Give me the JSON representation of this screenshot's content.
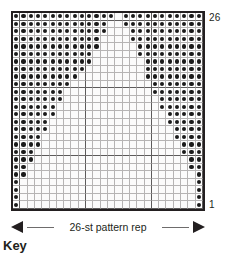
{
  "chart_data": {
    "type": "heatmap",
    "title": "",
    "subtitle": "",
    "xlabel": "26-st pattern rep",
    "ylabel": "",
    "grid": true,
    "legend_position": "below",
    "columns": 26,
    "rows": 26,
    "row_labels_shown": [
      "26",
      "1"
    ],
    "row_label_top": "26",
    "row_label_bottom": "1",
    "cell_values": {
      "filled": "dot symbol stitch",
      "empty": "blank stitch"
    },
    "colors": {
      "filled_dot": "#1a1a1a",
      "cell_background": "#fbfbfb",
      "grid_line": "#b6b4b4",
      "heavy_grid_line": "#5d5b5b",
      "border": "#231f20",
      "text": "#231f20"
    },
    "heavy_gridline_columns": [
      1,
      10,
      19,
      26
    ],
    "heavy_gridline_rows": [
      1,
      10,
      19,
      26
    ],
    "matrix": [
      [
        1,
        1,
        1,
        1,
        1,
        1,
        1,
        1,
        1,
        1,
        1,
        1,
        1,
        1,
        0,
        1,
        1,
        1,
        1,
        1,
        1,
        1,
        1,
        1,
        1,
        1
      ],
      [
        1,
        1,
        1,
        1,
        1,
        1,
        1,
        1,
        1,
        1,
        1,
        1,
        1,
        0,
        0,
        1,
        1,
        1,
        1,
        1,
        1,
        1,
        1,
        1,
        1,
        1
      ],
      [
        1,
        1,
        1,
        1,
        1,
        1,
        1,
        1,
        1,
        1,
        1,
        1,
        1,
        0,
        0,
        0,
        1,
        1,
        1,
        1,
        1,
        1,
        1,
        1,
        1,
        1
      ],
      [
        1,
        1,
        1,
        1,
        1,
        1,
        1,
        1,
        1,
        1,
        1,
        1,
        0,
        0,
        0,
        0,
        1,
        1,
        1,
        1,
        1,
        1,
        1,
        1,
        1,
        1
      ],
      [
        1,
        1,
        1,
        1,
        1,
        1,
        1,
        1,
        1,
        1,
        1,
        1,
        0,
        0,
        0,
        0,
        0,
        1,
        1,
        1,
        1,
        1,
        1,
        1,
        1,
        1
      ],
      [
        1,
        1,
        1,
        1,
        1,
        1,
        1,
        1,
        1,
        1,
        1,
        0,
        0,
        0,
        0,
        0,
        0,
        1,
        1,
        1,
        1,
        1,
        1,
        1,
        1,
        1
      ],
      [
        1,
        1,
        1,
        1,
        1,
        1,
        1,
        1,
        1,
        1,
        1,
        0,
        0,
        0,
        0,
        0,
        0,
        0,
        1,
        1,
        1,
        1,
        1,
        1,
        1,
        1
      ],
      [
        1,
        1,
        1,
        1,
        1,
        1,
        1,
        1,
        1,
        1,
        0,
        0,
        0,
        0,
        0,
        0,
        0,
        0,
        1,
        1,
        1,
        1,
        1,
        1,
        1,
        1
      ],
      [
        1,
        1,
        1,
        1,
        1,
        1,
        1,
        1,
        1,
        0,
        0,
        0,
        0,
        0,
        0,
        0,
        0,
        0,
        1,
        1,
        1,
        1,
        1,
        1,
        1,
        1
      ],
      [
        1,
        1,
        1,
        1,
        1,
        1,
        1,
        1,
        0,
        0,
        0,
        0,
        0,
        0,
        0,
        0,
        0,
        0,
        0,
        1,
        1,
        1,
        1,
        1,
        1,
        1
      ],
      [
        1,
        1,
        1,
        1,
        1,
        1,
        1,
        0,
        0,
        0,
        0,
        0,
        0,
        0,
        0,
        0,
        0,
        0,
        0,
        1,
        1,
        1,
        1,
        1,
        1,
        1
      ],
      [
        1,
        1,
        1,
        1,
        1,
        1,
        1,
        0,
        0,
        0,
        0,
        0,
        0,
        0,
        0,
        0,
        0,
        0,
        0,
        0,
        1,
        1,
        1,
        1,
        1,
        1
      ],
      [
        1,
        1,
        1,
        1,
        1,
        1,
        0,
        0,
        0,
        0,
        0,
        0,
        0,
        0,
        0,
        0,
        0,
        0,
        0,
        0,
        1,
        1,
        1,
        1,
        1,
        1
      ],
      [
        1,
        1,
        1,
        1,
        1,
        1,
        0,
        0,
        0,
        0,
        0,
        0,
        0,
        0,
        0,
        0,
        0,
        0,
        0,
        0,
        0,
        1,
        1,
        1,
        1,
        1
      ],
      [
        1,
        1,
        1,
        1,
        1,
        0,
        0,
        0,
        0,
        0,
        0,
        0,
        0,
        0,
        0,
        0,
        0,
        0,
        0,
        0,
        0,
        1,
        1,
        1,
        1,
        1
      ],
      [
        1,
        1,
        1,
        1,
        1,
        0,
        0,
        0,
        0,
        0,
        0,
        0,
        0,
        0,
        0,
        0,
        0,
        0,
        0,
        0,
        0,
        0,
        1,
        1,
        1,
        1
      ],
      [
        1,
        1,
        1,
        1,
        0,
        0,
        0,
        0,
        0,
        0,
        0,
        0,
        0,
        0,
        0,
        0,
        0,
        0,
        0,
        0,
        0,
        0,
        1,
        1,
        1,
        1
      ],
      [
        1,
        1,
        1,
        1,
        0,
        0,
        0,
        0,
        0,
        0,
        0,
        0,
        0,
        0,
        0,
        0,
        0,
        0,
        0,
        0,
        0,
        0,
        0,
        1,
        1,
        1
      ],
      [
        1,
        1,
        1,
        0,
        0,
        0,
        0,
        0,
        0,
        0,
        0,
        0,
        0,
        0,
        0,
        0,
        0,
        0,
        0,
        0,
        0,
        0,
        0,
        1,
        1,
        1
      ],
      [
        1,
        1,
        1,
        0,
        0,
        0,
        0,
        0,
        0,
        0,
        0,
        0,
        0,
        0,
        0,
        0,
        0,
        0,
        0,
        0,
        0,
        0,
        0,
        0,
        1,
        1
      ],
      [
        1,
        1,
        0,
        0,
        0,
        0,
        0,
        0,
        0,
        0,
        0,
        0,
        0,
        0,
        0,
        0,
        0,
        0,
        0,
        0,
        0,
        0,
        0,
        0,
        1,
        1
      ],
      [
        1,
        1,
        0,
        0,
        0,
        0,
        0,
        0,
        0,
        0,
        0,
        0,
        0,
        0,
        0,
        0,
        0,
        0,
        0,
        0,
        0,
        0,
        0,
        0,
        0,
        1
      ],
      [
        1,
        0,
        0,
        0,
        0,
        0,
        0,
        0,
        0,
        0,
        0,
        0,
        0,
        0,
        0,
        0,
        0,
        0,
        0,
        0,
        0,
        0,
        0,
        0,
        0,
        1
      ],
      [
        1,
        0,
        0,
        0,
        0,
        0,
        0,
        0,
        0,
        0,
        0,
        0,
        0,
        0,
        0,
        0,
        0,
        0,
        0,
        0,
        0,
        0,
        0,
        0,
        0,
        1
      ],
      [
        1,
        0,
        0,
        0,
        0,
        0,
        0,
        0,
        0,
        0,
        0,
        0,
        0,
        0,
        0,
        0,
        0,
        0,
        0,
        0,
        0,
        0,
        0,
        0,
        0,
        1
      ],
      [
        1,
        0,
        0,
        0,
        0,
        0,
        0,
        0,
        0,
        0,
        0,
        0,
        0,
        0,
        0,
        0,
        0,
        0,
        0,
        0,
        0,
        0,
        0,
        0,
        0,
        1
      ]
    ]
  },
  "chart": {
    "row_label_top": "26",
    "row_label_bottom": "1"
  },
  "repeat": {
    "label": "26-st pattern rep"
  },
  "key": {
    "heading": "Key"
  }
}
